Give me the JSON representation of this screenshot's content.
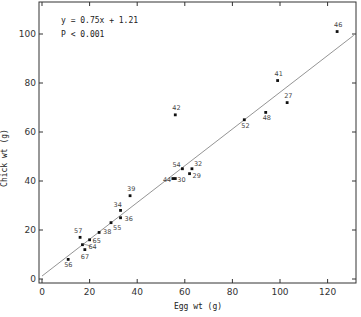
{
  "chart_data": {
    "type": "scatter",
    "title": "",
    "xlabel": "Egg wt (g)",
    "ylabel": "Chick wt (g)",
    "xlim": [
      0,
      131
    ],
    "ylim": [
      0,
      112
    ],
    "xticks": [
      0,
      20,
      40,
      60,
      80,
      100,
      120
    ],
    "yticks": [
      0,
      20,
      40,
      60,
      80,
      100
    ],
    "xtick_labels": [
      "0",
      "20",
      "40",
      "60",
      "80",
      "100",
      "120"
    ],
    "ytick_labels": [
      "0",
      "20",
      "40",
      "60",
      "80",
      "100"
    ],
    "grid": false,
    "legend": null,
    "annotations": [
      "y = 0.75x + 1.21",
      "P < 0.001"
    ],
    "regression": {
      "slope": 0.75,
      "intercept": 1.21,
      "x_range": [
        0,
        131
      ]
    },
    "points": [
      {
        "label": "56",
        "x": 11,
        "y": 8
      },
      {
        "label": "67",
        "x": 18,
        "y": 12
      },
      {
        "label": "64",
        "x": 17,
        "y": 14
      },
      {
        "label": "57",
        "x": 16,
        "y": 17
      },
      {
        "label": "65",
        "x": 20,
        "y": 16
      },
      {
        "label": "38",
        "x": 24,
        "y": 19
      },
      {
        "label": "55",
        "x": 29,
        "y": 23
      },
      {
        "label": "36",
        "x": 33,
        "y": 25
      },
      {
        "label": "34",
        "x": 33,
        "y": 28
      },
      {
        "label": "39",
        "x": 37,
        "y": 34
      },
      {
        "label": "44",
        "x": 55,
        "y": 41
      },
      {
        "label": "30",
        "x": 56,
        "y": 41
      },
      {
        "label": "54",
        "x": 59,
        "y": 45
      },
      {
        "label": "32",
        "x": 63,
        "y": 45
      },
      {
        "label": "29",
        "x": 62,
        "y": 43
      },
      {
        "label": "42",
        "x": 56,
        "y": 67
      },
      {
        "label": "52",
        "x": 85,
        "y": 65
      },
      {
        "label": "48",
        "x": 94,
        "y": 68
      },
      {
        "label": "41",
        "x": 99,
        "y": 81
      },
      {
        "label": "27",
        "x": 103,
        "y": 72
      },
      {
        "label": "46",
        "x": 124,
        "y": 101
      }
    ]
  },
  "layout": {
    "plot": {
      "left": 39,
      "right": 356,
      "top": 2,
      "bottom": 283
    },
    "x0px": 42,
    "xscale": 2.38,
    "y0px": 279,
    "yscale": 2.45,
    "label_offsets": {
      "56": [
        -4,
        8
      ],
      "67": [
        -4,
        9
      ],
      "64": [
        6,
        4
      ],
      "57": [
        -6,
        -4
      ],
      "65": [
        3,
        3
      ],
      "38": [
        4,
        2
      ],
      "55": [
        2,
        7
      ],
      "36": [
        4,
        3
      ],
      "34": [
        -7,
        -3
      ],
      "39": [
        -3,
        -5
      ],
      "44": [
        -10,
        3
      ],
      "30": [
        2,
        3
      ],
      "54": [
        -10,
        -2
      ],
      "32": [
        2,
        -3
      ],
      "29": [
        3,
        4
      ],
      "42": [
        -3,
        -5
      ],
      "52": [
        -3,
        8
      ],
      "48": [
        -3,
        8
      ],
      "41": [
        -3,
        -5
      ],
      "27": [
        -3,
        -5
      ],
      "46": [
        -3,
        -5
      ]
    },
    "leader_lines": {
      "64": [
        [
          83,
          244
        ],
        [
          91,
          246
        ]
      ]
    }
  },
  "colors": {
    "axis": "#333333",
    "point": "#111111",
    "line": "#888888"
  }
}
